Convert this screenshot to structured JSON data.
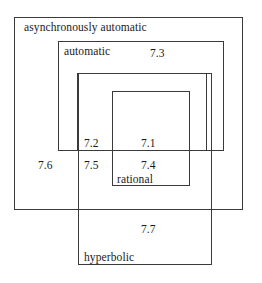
{
  "diagram": {
    "type": "nested-boxes",
    "stroke_color": "#3a3a3a",
    "background": "#ffffff",
    "classes": [
      {
        "id": "asynchronously-automatic",
        "label": "asynchronously automatic",
        "rect": [
          14,
          17,
          229,
          193
        ]
      },
      {
        "id": "automatic",
        "label": "automatic",
        "rect": [
          58,
          41,
          166,
          110
        ]
      },
      {
        "id": "unlabeled-inner",
        "label": "",
        "rect": [
          77,
          73,
          130,
          78
        ]
      },
      {
        "id": "rational",
        "label": "rational",
        "rect": [
          112,
          91,
          78,
          95
        ]
      },
      {
        "id": "hyperbolic",
        "label": "hyperbolic",
        "rect": [
          78,
          73,
          134,
          192
        ]
      }
    ],
    "region_labels": [
      {
        "id": "region-7-3",
        "text": "7.3",
        "x": 150,
        "y": 48
      },
      {
        "id": "region-7-2",
        "text": "7.2",
        "x": 84,
        "y": 138
      },
      {
        "id": "region-7-1",
        "text": "7.1",
        "x": 141,
        "y": 138
      },
      {
        "id": "region-7-6",
        "text": "7.6",
        "x": 38,
        "y": 160
      },
      {
        "id": "region-7-5",
        "text": "7.5",
        "x": 84,
        "y": 160
      },
      {
        "id": "region-7-4",
        "text": "7.4",
        "x": 141,
        "y": 160
      },
      {
        "id": "region-7-7",
        "text": "7.7",
        "x": 141,
        "y": 224
      }
    ],
    "class_labels": [
      {
        "id": "label-asynchronously-automatic",
        "text": "asynchronously automatic",
        "x": 24,
        "y": 22
      },
      {
        "id": "label-automatic",
        "text": "automatic",
        "x": 64,
        "y": 46
      },
      {
        "id": "label-rational",
        "text": "rational",
        "x": 117,
        "y": 174
      },
      {
        "id": "label-hyperbolic",
        "text": "hyperbolic",
        "x": 84,
        "y": 252
      }
    ]
  }
}
